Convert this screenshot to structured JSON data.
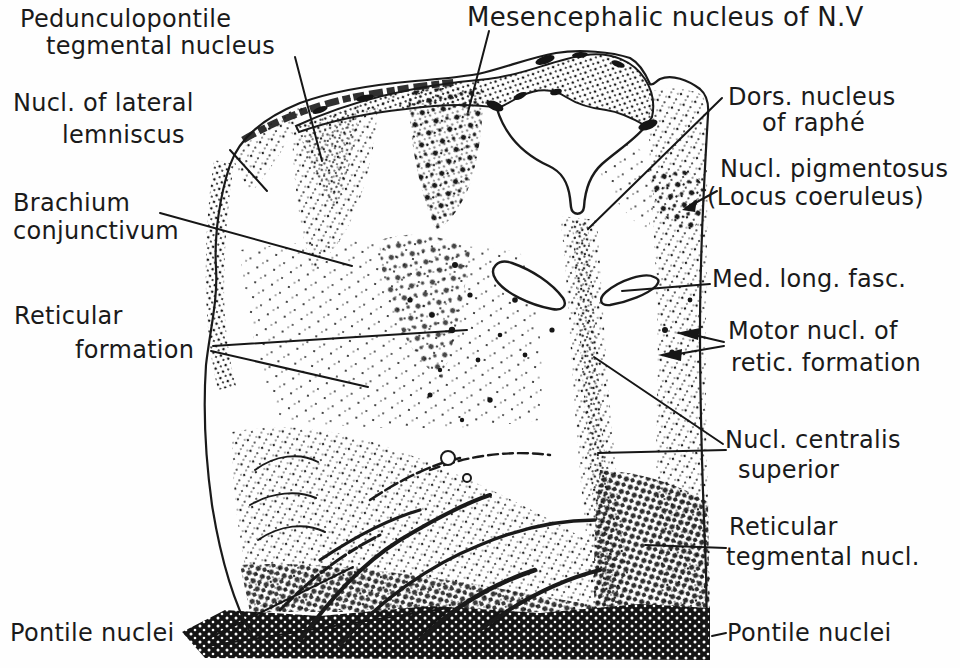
{
  "figure": {
    "paper_color": "#fefefe",
    "ink_color": "#1a1a1a",
    "type": "anatomical cross-section of pons with stippled histological texture"
  },
  "labels": {
    "pedunculopontile": {
      "line1": "Pedunculopontile",
      "line2": "tegmental nucleus"
    },
    "mesencephalic": {
      "line1": "Mesencephalic nucleus of N.V"
    },
    "lateral_lemniscus": {
      "line1": "Nucl. of lateral",
      "line2": "lemniscus"
    },
    "brachium": {
      "line1": "Brachium",
      "line2": "conjunctivum"
    },
    "reticular_formation": {
      "line1": "Reticular",
      "line2": "formation"
    },
    "pontile_left": {
      "line1": "Pontile nuclei"
    },
    "dors_raphe": {
      "line1": "Dors. nucleus",
      "line2": "of raphé"
    },
    "pigmentosus": {
      "line1": "Nucl. pigmentosus",
      "line2": "(Locus coeruleus)"
    },
    "med_long_fasc": {
      "line1": "Med. long. fasc."
    },
    "motor_retic": {
      "line1": "Motor nucl. of",
      "line2": "retic. formation"
    },
    "centralis_superior": {
      "line1": "Nucl. centralis",
      "line2": "superior"
    },
    "reticular_tegmental": {
      "line1": "Reticular",
      "line2": "tegmental nucl."
    },
    "pontile_right": {
      "line1": "Pontile nuclei"
    }
  }
}
